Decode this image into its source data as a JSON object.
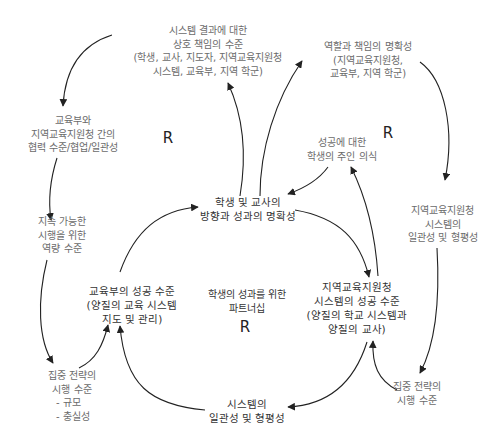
{
  "diagram": {
    "type": "causal-loop",
    "nodes": {
      "mutual_accountability": {
        "lines": [
          "시스템 결과에 대한",
          "상호 책임의 수준",
          "(학생, 교사, 지도자, 지역교육지원청",
          "시스템, 교육부, 지역 학군)"
        ]
      },
      "role_clarity": {
        "lines": [
          "역할과 책임의 명확성",
          "(지역교육지원청,",
          "교육부, 지역 학군)"
        ]
      },
      "collaboration": {
        "lines": [
          "교육부와",
          "지역교육지원청 간의",
          "협력 수준/협업/일관성"
        ]
      },
      "sustainable_capacity": {
        "lines": [
          "지속 가능한",
          "시행을 위한",
          "역량 수준"
        ]
      },
      "student_ownership": {
        "lines": [
          "성공에 대한",
          "학생의 주인 의식"
        ]
      },
      "direction_clarity": {
        "lines": [
          "학생 및 교사의",
          "방향과 성과의 명확성"
        ]
      },
      "regional_consistency": {
        "lines": [
          "지역교육지원청",
          "시스템의",
          "일관성 및 형평성"
        ]
      },
      "ministry_success": {
        "lines": [
          "교육부의 성공 수준",
          "(양질의 교육 시스템",
          "지도 및 관리)"
        ]
      },
      "regional_success": {
        "lines": [
          "지역교육지원청",
          "시스템의 성공 수준",
          "(양질의 학교 시스템과",
          "양질의 교사)"
        ]
      },
      "focused_strategy_left": {
        "lines": [
          "집중 전략의",
          "시행 수준",
          "- 규모",
          "- 충실성"
        ]
      },
      "focused_strategy_right": {
        "lines": [
          "집중 전략의",
          "시행 수준"
        ]
      },
      "system_consistency": {
        "lines": [
          "시스템의",
          "일관성 및 형평성"
        ]
      }
    },
    "center": {
      "lines": [
        "학생의 성과를 위한",
        "파트너십"
      ],
      "loop_label": "R"
    },
    "loop_labels": {
      "left": "R",
      "right": "R"
    },
    "edges": [
      {
        "from": "mutual_accountability",
        "to": "collaboration"
      },
      {
        "from": "collaboration",
        "to": "sustainable_capacity"
      },
      {
        "from": "sustainable_capacity",
        "to": "focused_strategy_left"
      },
      {
        "from": "focused_strategy_left",
        "to": "ministry_success"
      },
      {
        "from": "system_consistency",
        "to": "ministry_success"
      },
      {
        "from": "ministry_success",
        "to": "direction_clarity"
      },
      {
        "from": "direction_clarity",
        "to": "mutual_accountability"
      },
      {
        "from": "direction_clarity",
        "to": "role_clarity"
      },
      {
        "from": "role_clarity",
        "to": "regional_consistency"
      },
      {
        "from": "regional_consistency",
        "to": "focused_strategy_right"
      },
      {
        "from": "focused_strategy_right",
        "to": "regional_success"
      },
      {
        "from": "regional_success",
        "to": "system_consistency"
      },
      {
        "from": "direction_clarity",
        "to": "regional_success"
      },
      {
        "from": "regional_success",
        "to": "student_ownership"
      },
      {
        "from": "student_ownership",
        "to": "direction_clarity"
      }
    ],
    "colors": {
      "edge": "#222222",
      "node_text": "#6b6b6b",
      "core_text": "#333333",
      "background": "#ffffff"
    }
  }
}
